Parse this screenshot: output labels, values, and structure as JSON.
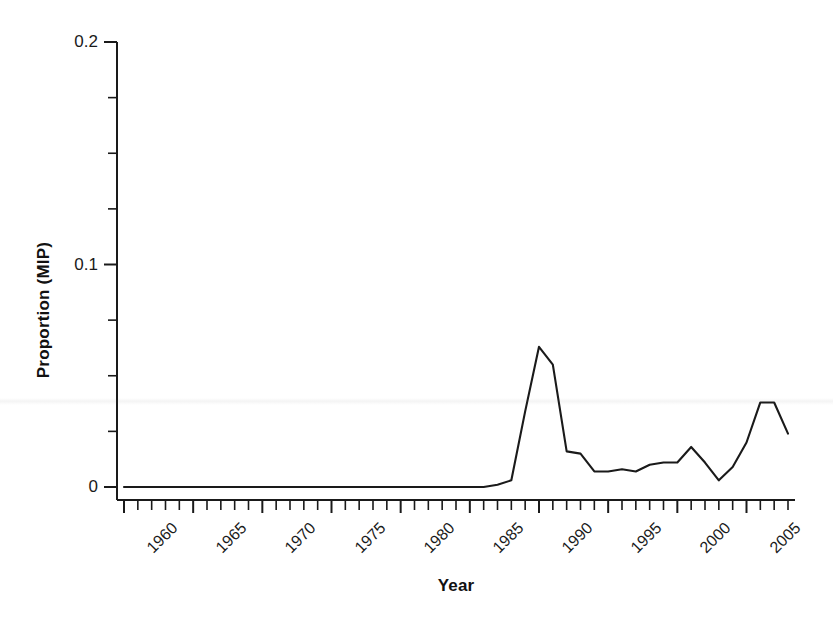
{
  "chart_data": {
    "type": "line",
    "title": "",
    "xlabel": "Year",
    "ylabel": "Proportion (MIP)",
    "xlim": [
      1960,
      2008
    ],
    "ylim": [
      0,
      0.2
    ],
    "grid": false,
    "legend": null,
    "y_tick_labels": [
      "0",
      "0.1",
      "0.2"
    ],
    "y_tick_values": [
      0,
      0.1,
      0.2
    ],
    "y_minor_tick_values": [
      0.025,
      0.05,
      0.075,
      0.125,
      0.15,
      0.175
    ],
    "x_tick_labels": [
      "1960",
      "1965",
      "1970",
      "1975",
      "1980",
      "1985",
      "1990",
      "1995",
      "2000",
      "2005"
    ],
    "x_tick_values": [
      1960,
      1965,
      1970,
      1975,
      1980,
      1985,
      1990,
      1995,
      2000,
      2005
    ],
    "x_minor_tick_step": 1,
    "line_color": "#1a1a1a",
    "line_width": 2.1,
    "series": [
      {
        "name": "Proportion (MIP)",
        "x": [
          1960,
          1961,
          1962,
          1963,
          1964,
          1965,
          1966,
          1967,
          1968,
          1969,
          1970,
          1971,
          1972,
          1973,
          1974,
          1975,
          1976,
          1977,
          1978,
          1979,
          1980,
          1981,
          1982,
          1983,
          1984,
          1985,
          1986,
          1987,
          1988,
          1989,
          1990,
          1991,
          1992,
          1993,
          1994,
          1995,
          1996,
          1997,
          1998,
          1999,
          2000,
          2001,
          2002,
          2003,
          2004,
          2005,
          2006,
          2007,
          2008
        ],
        "values": [
          0,
          0,
          0,
          0,
          0,
          0,
          0,
          0,
          0,
          0,
          0,
          0,
          0,
          0,
          0,
          0,
          0,
          0,
          0,
          0,
          0,
          0,
          0,
          0,
          0,
          0,
          0,
          0.001,
          0.003,
          0.034,
          0.063,
          0.055,
          0.016,
          0.015,
          0.007,
          0.007,
          0.008,
          0.007,
          0.01,
          0.011,
          0.011,
          0.018,
          0.011,
          0.003,
          0.009,
          0.02,
          0.038,
          0.038,
          0.024
        ]
      }
    ]
  }
}
